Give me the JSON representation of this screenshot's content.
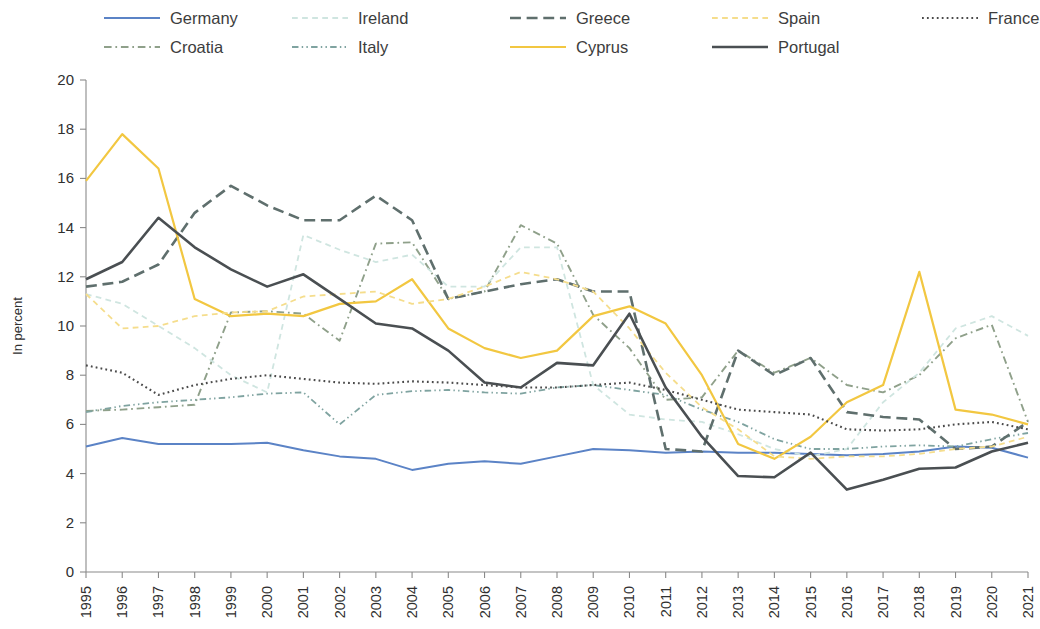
{
  "chart_data": {
    "type": "line",
    "title": "",
    "xlabel": "",
    "ylabel": "In percent",
    "ylim": [
      0,
      20
    ],
    "ytick_step": 2,
    "yticks": [
      "0",
      "2",
      "4",
      "6",
      "8",
      "10",
      "12",
      "14",
      "16",
      "18",
      "20"
    ],
    "grid": false,
    "legend_position": "top",
    "legend_rows": 2,
    "legend_columns": 5,
    "x": [
      "1995",
      "1996",
      "1997",
      "1998",
      "1999",
      "2000",
      "2001",
      "2002",
      "2003",
      "2004",
      "2005",
      "2006",
      "2007",
      "2008",
      "2009",
      "2010",
      "2011",
      "2012",
      "2013",
      "2014",
      "2015",
      "2016",
      "2017",
      "2018",
      "2019",
      "2020",
      "2021"
    ],
    "series": [
      {
        "name": "Germany",
        "color": "#5b83c6",
        "dash": "none",
        "width": 2.0,
        "values": [
          5.1,
          5.45,
          5.2,
          5.2,
          5.2,
          5.25,
          4.95,
          4.7,
          4.6,
          4.15,
          4.4,
          4.5,
          4.4,
          4.7,
          5.0,
          4.95,
          4.85,
          4.9,
          4.85,
          4.85,
          4.8,
          4.75,
          4.8,
          4.9,
          5.1,
          5.05,
          4.65
        ]
      },
      {
        "name": "Croatia",
        "color": "#8fa08a",
        "dash": "dashdot",
        "width": 1.9,
        "values": [
          6.55,
          6.6,
          6.7,
          6.8,
          10.55,
          10.6,
          10.5,
          9.4,
          13.35,
          13.4,
          11.1,
          11.4,
          14.1,
          13.35,
          10.45,
          9.1,
          7.0,
          7.1,
          9.0,
          8.1,
          8.7,
          7.6,
          7.3,
          8.0,
          9.5,
          10.05,
          6.1
        ]
      },
      {
        "name": "Ireland",
        "color": "#cfe5e0",
        "dash": "dashed",
        "width": 1.8,
        "values": [
          11.3,
          10.9,
          10.0,
          9.1,
          8.0,
          7.3,
          13.7,
          13.1,
          12.6,
          12.9,
          11.6,
          11.6,
          13.2,
          13.2,
          7.6,
          6.4,
          6.2,
          6.1,
          5.6,
          5.0,
          4.7,
          5.0,
          6.9,
          8.1,
          9.9,
          10.4,
          9.6
        ]
      },
      {
        "name": "Italy",
        "color": "#7fa3a0",
        "dash": "dashdotdot",
        "width": 1.8,
        "values": [
          6.5,
          6.75,
          6.9,
          7.0,
          7.1,
          7.25,
          7.3,
          6.0,
          7.2,
          7.35,
          7.4,
          7.3,
          7.25,
          7.5,
          7.6,
          7.4,
          7.2,
          6.6,
          6.1,
          5.4,
          5.0,
          5.0,
          5.1,
          5.15,
          5.1,
          5.4,
          5.65
        ]
      },
      {
        "name": "Greece",
        "color": "#5f6f6d",
        "dash": "longdash",
        "width": 2.6,
        "values": [
          11.6,
          11.8,
          12.5,
          14.6,
          15.7,
          14.9,
          14.3,
          14.3,
          15.3,
          14.3,
          11.1,
          11.4,
          11.7,
          11.9,
          11.4,
          11.4,
          5.0,
          4.9,
          9.0,
          8.0,
          8.7,
          6.5,
          6.3,
          6.2,
          5.0,
          5.1,
          6.1
        ]
      },
      {
        "name": "Cyprus",
        "color": "#f2c741",
        "dash": "none",
        "width": 2.2,
        "values": [
          15.9,
          17.8,
          16.4,
          11.1,
          10.4,
          10.5,
          10.4,
          10.9,
          11.0,
          11.9,
          9.9,
          9.1,
          8.7,
          9.0,
          10.4,
          10.8,
          10.1,
          8.0,
          5.2,
          4.6,
          5.5,
          6.9,
          7.6,
          12.2,
          6.6,
          6.4,
          6.0
        ]
      },
      {
        "name": "Spain",
        "color": "#f5dd8c",
        "dash": "dashed",
        "width": 1.8,
        "values": [
          11.3,
          9.9,
          10.0,
          10.4,
          10.55,
          10.6,
          11.2,
          11.3,
          11.4,
          10.9,
          11.1,
          11.6,
          12.2,
          11.9,
          11.4,
          9.9,
          8.1,
          6.7,
          5.8,
          4.7,
          4.6,
          4.7,
          4.7,
          4.8,
          5.0,
          5.1,
          5.5
        ]
      },
      {
        "name": "Portugal",
        "color": "#4a4f52",
        "dash": "none",
        "width": 2.6,
        "values": [
          11.9,
          12.6,
          14.4,
          13.2,
          12.3,
          11.6,
          12.1,
          11.1,
          10.1,
          9.9,
          9.0,
          7.7,
          7.5,
          8.5,
          8.4,
          10.5,
          7.5,
          5.5,
          3.9,
          3.85,
          4.85,
          3.35,
          3.75,
          4.2,
          4.25,
          4.9,
          5.25
        ]
      },
      {
        "name": "France",
        "color": "#4a4a4a",
        "dash": "dotted",
        "width": 2.1,
        "values": [
          8.4,
          8.1,
          7.2,
          7.6,
          7.85,
          8.0,
          7.85,
          7.7,
          7.65,
          7.75,
          7.7,
          7.6,
          7.5,
          7.5,
          7.6,
          7.7,
          7.4,
          7.0,
          6.6,
          6.5,
          6.4,
          5.8,
          5.75,
          5.8,
          6.0,
          6.1,
          5.8
        ]
      }
    ],
    "legend_order": [
      "Germany",
      "Ireland",
      "Greece",
      "Spain",
      "France",
      "Croatia",
      "Italy",
      "Cyprus",
      "Portugal"
    ]
  }
}
